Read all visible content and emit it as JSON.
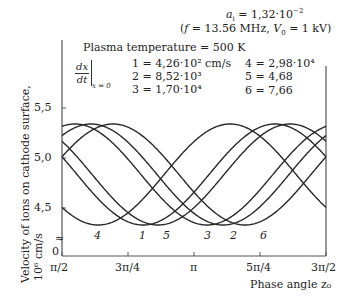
{
  "chart_data": {
    "type": "line",
    "title": "",
    "annotations": {
      "ai": "aᵢ = 1,32·10⁻²",
      "conditions": "(f = 13.56 MHz,  V₀ = 1 kV)",
      "plasma_temperature": "Plasma temperature =  500 K",
      "legend_header": "dx/dt |x = 0"
    },
    "xlabel": "Phase angle z₀",
    "ylabel_line1": "Velocity of ions on cathode surface,",
    "ylabel_line2": "10⁶ cm/s",
    "x_ticks": [
      "π/2",
      "3π/4",
      "π",
      "5π/4",
      "3π/2"
    ],
    "y_ticks": [
      "5,5",
      "5,0",
      "4,5"
    ],
    "y_zero_label": "0",
    "axis_break": "≈",
    "xlim": [
      "π/2",
      "3π/2"
    ],
    "ylim": [
      4.2,
      5.9
    ],
    "grid": false,
    "legend": [
      {
        "id": "1",
        "label": "1 = 4,26·10² cm/s"
      },
      {
        "id": "2",
        "label": "2 = 8,52·10³"
      },
      {
        "id": "3",
        "label": "3 = 1,70·10⁴"
      },
      {
        "id": "4",
        "label": "4 = 2,98·10⁴"
      },
      {
        "id": "5",
        "label": "5 = 4,68"
      },
      {
        "id": "6",
        "label": "6 = 7,66"
      }
    ],
    "series": [
      {
        "name": "4",
        "min_phase_frac": 0.137,
        "v_max": 5.34,
        "v_min": 4.33
      },
      {
        "name": "1",
        "min_phase_frac": 0.307,
        "v_max": 5.34,
        "v_min": 4.33
      },
      {
        "name": "5",
        "min_phase_frac": 0.364,
        "v_max": 5.34,
        "v_min": 4.33
      },
      {
        "name": "3",
        "min_phase_frac": 0.549,
        "v_max": 5.34,
        "v_min": 4.33
      },
      {
        "name": "2",
        "min_phase_frac": 0.61,
        "v_max": 5.34,
        "v_min": 4.33
      },
      {
        "name": "6",
        "min_phase_frac": 0.693,
        "v_max": 5.34,
        "v_min": 4.33
      }
    ],
    "curve_labels": [
      {
        "text": "4",
        "x": 97
      },
      {
        "text": "1",
        "x": 142
      },
      {
        "text": "5",
        "x": 166
      },
      {
        "text": "3",
        "x": 207
      },
      {
        "text": "2",
        "x": 233
      },
      {
        "text": "6",
        "x": 263
      }
    ]
  }
}
